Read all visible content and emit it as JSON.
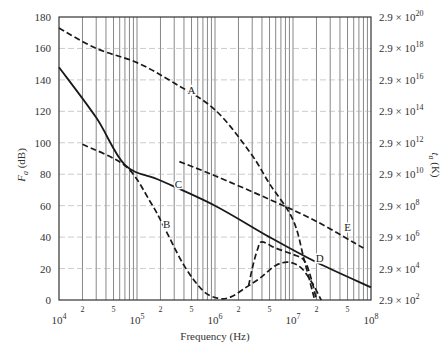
{
  "chart_data": {
    "type": "line",
    "title": "",
    "xlabel": "Frequency (Hz)",
    "ylabel": "F_a (dB)",
    "ylabel_main": "F",
    "ylabel_sub": "a",
    "ylabel_unit": " (dB)",
    "y2label_main": "t",
    "y2label_sub": "a",
    "y2label_unit": " (K)",
    "xscale": "log",
    "xlim": [
      10000,
      100000000
    ],
    "ylim": [
      0,
      180
    ],
    "grid": true,
    "yticks": [
      0,
      20,
      40,
      60,
      80,
      100,
      120,
      140,
      160,
      180
    ],
    "xticks_major": [
      {
        "value": 10000,
        "base": "10",
        "exp": "4"
      },
      {
        "value": 100000,
        "base": "10",
        "exp": "5"
      },
      {
        "value": 1000000,
        "base": "10",
        "exp": "6"
      },
      {
        "value": 10000000,
        "base": "10",
        "exp": "7"
      },
      {
        "value": 100000000,
        "base": "10",
        "exp": "8"
      }
    ],
    "xticks_minor_labels": [
      "2",
      "5"
    ],
    "y2ticks": [
      {
        "db": 0,
        "mant": "2.9 × 10",
        "exp": "2"
      },
      {
        "db": 20,
        "mant": "2.9 × 10",
        "exp": "4"
      },
      {
        "db": 40,
        "mant": "2.9 × 10",
        "exp": "6"
      },
      {
        "db": 60,
        "mant": "2.9 × 10",
        "exp": "8"
      },
      {
        "db": 80,
        "mant": "2.9 × 10",
        "exp": "10"
      },
      {
        "db": 100,
        "mant": "2.9 × 10",
        "exp": "12"
      },
      {
        "db": 120,
        "mant": "2.9 × 10",
        "exp": "14"
      },
      {
        "db": 140,
        "mant": "2.9 × 10",
        "exp": "16"
      },
      {
        "db": 160,
        "mant": "2.9 × 10",
        "exp": "18"
      },
      {
        "db": 180,
        "mant": "2.9 × 10",
        "exp": "20"
      }
    ],
    "series": [
      {
        "name": "A",
        "style": "dashed",
        "label_at": {
          "x": 500000,
          "y": 131
        },
        "points": [
          [
            10000,
            173
          ],
          [
            30000,
            160
          ],
          [
            100000,
            151
          ],
          [
            300000,
            138
          ],
          [
            1000000,
            121
          ],
          [
            2800000,
            94
          ],
          [
            5000000,
            74
          ],
          [
            10000000,
            51
          ],
          [
            14000000,
            25
          ],
          [
            19000000,
            0
          ]
        ]
      },
      {
        "name": "B",
        "style": "dashed",
        "label_at": {
          "x": 240000,
          "y": 46
        },
        "points": [
          [
            20000,
            99
          ],
          [
            72000,
            85
          ],
          [
            150000,
            62
          ],
          [
            230000,
            45
          ],
          [
            400000,
            22
          ],
          [
            700000,
            6
          ],
          [
            1100000,
            1
          ],
          [
            1600000,
            2
          ],
          [
            2500000,
            8
          ],
          [
            3800000,
            14
          ],
          [
            6000000,
            22
          ],
          [
            9000000,
            24
          ],
          [
            13000000,
            20
          ],
          [
            18000000,
            10
          ],
          [
            23000000,
            0
          ]
        ]
      },
      {
        "name": "C",
        "style": "solid",
        "label_at": {
          "x": 340000,
          "y": 71
        },
        "points": [
          [
            10000,
            148
          ],
          [
            30000,
            116
          ],
          [
            70000,
            86
          ],
          [
            200000,
            76
          ],
          [
            1000000,
            60
          ],
          [
            5000000,
            40
          ],
          [
            20000000,
            24
          ],
          [
            100000000,
            8
          ]
        ]
      },
      {
        "name": "D",
        "style": "dashed",
        "label_at": {
          "x": 22000000,
          "y": 24
        },
        "points": [
          [
            2700000,
            9
          ],
          [
            3000000,
            20
          ],
          [
            3500000,
            32
          ],
          [
            4000000,
            37
          ],
          [
            6000000,
            33
          ],
          [
            10000000,
            29
          ],
          [
            14000000,
            25
          ],
          [
            17000000,
            14
          ],
          [
            20000000,
            0
          ]
        ]
      },
      {
        "name": "E",
        "style": "dashed",
        "label_at": {
          "x": 50000000,
          "y": 44
        },
        "points": [
          [
            350000,
            88
          ],
          [
            1000000,
            79
          ],
          [
            5000000,
            64
          ],
          [
            20000000,
            50
          ],
          [
            80000000,
            33
          ]
        ]
      }
    ]
  }
}
